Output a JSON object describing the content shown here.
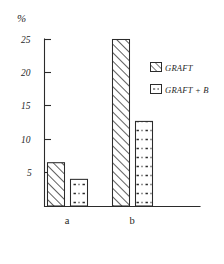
{
  "chart_data": {
    "type": "bar",
    "title": "",
    "xlabel": "",
    "ylabel": "%",
    "ylim": [
      0,
      26.5
    ],
    "yticks": [
      5,
      10,
      15,
      20,
      25
    ],
    "ytick_labels": [
      "5",
      "10",
      "15",
      "20",
      "25"
    ],
    "grid": false,
    "legend_position": "right",
    "categories": [
      "a",
      "b"
    ],
    "series": [
      {
        "name": "GRAFT",
        "fill": "diagonal-hatch",
        "values": [
          6.5,
          25.0
        ]
      },
      {
        "name": "GRAFT + B",
        "fill": "dotted-dashed",
        "values": [
          4.0,
          12.7
        ]
      }
    ]
  },
  "axis": {
    "unit_label": "%",
    "ytick_labels": [
      "25",
      "20",
      "15",
      "10",
      "5"
    ],
    "category_labels": [
      "a",
      "b"
    ]
  },
  "legend": {
    "entries": [
      {
        "label": "GRAFT",
        "swatch": "hatch-swatch"
      },
      {
        "label": "GRAFT + B",
        "swatch": "dotted-swatch"
      }
    ]
  },
  "colors": {
    "ink": "#2b2b2b",
    "background": "#ffffff"
  }
}
